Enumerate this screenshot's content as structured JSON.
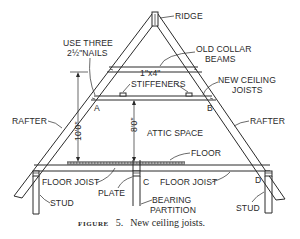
{
  "figure": {
    "caption_prefix": "FIGURE",
    "caption_number": "5.",
    "caption_text": "New ceiling joists."
  },
  "labels": {
    "ridge": "RIDGE",
    "nails_line1": "USE THREE",
    "nails_line2": "2½\"NAILS",
    "old_collar_line1": "OLD COLLAR",
    "old_collar_line2": "BEAMS",
    "stiffeners_line1": "1\"x4\"",
    "stiffeners_line2": "STIFFENERS",
    "new_joists_line1": "NEW CEILING",
    "new_joists_line2": "JOISTS",
    "rafter_left": "RAFTER",
    "rafter_right": "RAFTER",
    "attic_space": "ATTIC SPACE",
    "floor": "FLOOR",
    "floor_joist_left": "FLOOR JOIST",
    "floor_joist_right": "FLOOR JOIST",
    "plate": "PLATE",
    "bearing_line1": "BEARING",
    "bearing_line2": "PARTITION",
    "stud_left": "STUD",
    "stud_right": "STUD",
    "point_a": "A",
    "point_b": "B",
    "point_c": "C",
    "point_d": "D"
  },
  "dimensions": {
    "total_height": "10'0\"",
    "ceiling_height": "8'0\""
  },
  "colors": {
    "ink": "#2a2a2a",
    "paper": "#ffffff"
  }
}
